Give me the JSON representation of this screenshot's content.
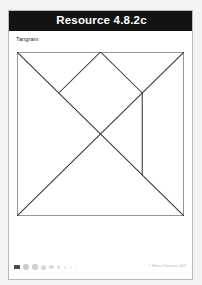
{
  "document": {
    "header": {
      "title": "Resource 4.8.2c",
      "background_color": "#131313",
      "text_color": "#ffffff"
    },
    "section_label": "Tangram",
    "page_background": "#ffffff",
    "page_border_color": "#b8b8b8",
    "scan_surround_color": "#f3f3f2"
  },
  "footer": {
    "badge_icon": "page-badge-icon",
    "credit": "© Nelson Education 2008",
    "dots": [
      {
        "name": "progress-dot-1"
      },
      {
        "name": "progress-dot-2"
      },
      {
        "name": "progress-dot-3"
      },
      {
        "name": "progress-dot-4"
      },
      {
        "name": "progress-dot-5"
      },
      {
        "name": "progress-dot-6"
      },
      {
        "name": "progress-dot-7"
      },
      {
        "name": "progress-dot-8"
      }
    ]
  },
  "figure": {
    "name": "tangram-diagram",
    "type": "tangram",
    "stroke_color": "#333333",
    "fill_color": "#ffffff",
    "viewbox": "0 0 100 100",
    "square": {
      "x": 0,
      "y": 0,
      "width": 100,
      "height": 100
    },
    "pieces": [
      {
        "name": "large-triangle-upper-left",
        "points": "0,0 50,0 0,50"
      },
      {
        "name": "large-triangle-lower-left",
        "points": "0,0 0,100 100,100"
      },
      {
        "name": "medium-triangle-right",
        "points": "50,0 100,0 100,50"
      },
      {
        "name": "small-triangle-top",
        "points": "50,0 75,25 25,25"
      },
      {
        "name": "square-center",
        "points": "25,25 50,50 75,25 50,0"
      },
      {
        "name": "small-triangle-right",
        "points": "75,25 100,50 75,75"
      },
      {
        "name": "parallelogram-right",
        "points": "75,25 75,75 100,100 100,50"
      }
    ],
    "segments": [
      {
        "name": "square-outline",
        "x1": 0,
        "y1": 0,
        "x2": 100,
        "y2": 0
      },
      {
        "name": "diagonal-main",
        "x1": 0,
        "y1": 0,
        "x2": 100,
        "y2": 100
      },
      {
        "name": "diagonal-anti",
        "x1": 100,
        "y1": 0,
        "x2": 0,
        "y2": 100
      },
      {
        "name": "apex-left",
        "x1": 50,
        "y1": 0,
        "x2": 25,
        "y2": 25
      },
      {
        "name": "apex-right",
        "x1": 50,
        "y1": 0,
        "x2": 75,
        "y2": 25
      },
      {
        "name": "vertical-right",
        "x1": 75,
        "y1": 25,
        "x2": 75,
        "y2": 75
      }
    ]
  }
}
